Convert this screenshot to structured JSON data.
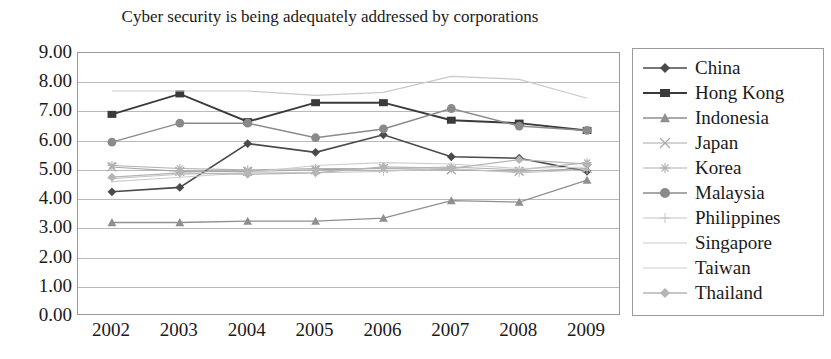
{
  "chart_data": {
    "type": "line",
    "title": "Cyber security is being adequately addressed by corporations",
    "xlabel": "",
    "ylabel": "",
    "categories": [
      "2002",
      "2003",
      "2004",
      "2005",
      "2006",
      "2007",
      "2008",
      "2009"
    ],
    "ylim": [
      0,
      9
    ],
    "ytick_step": 1,
    "yticks": [
      "9.00",
      "8.00",
      "7.00",
      "6.00",
      "5.00",
      "4.00",
      "3.00",
      "2.00",
      "1.00",
      "0.00"
    ],
    "grid": true,
    "legend_position": "right",
    "series": [
      {
        "name": "China",
        "marker": "diamond",
        "color": "#4a4a4a",
        "width": 1.6,
        "values": [
          4.25,
          4.4,
          5.9,
          5.6,
          6.2,
          5.45,
          5.4,
          4.95
        ]
      },
      {
        "name": "Hong Kong",
        "marker": "square",
        "color": "#3a3a3a",
        "width": 1.9,
        "values": [
          6.9,
          7.6,
          6.65,
          7.3,
          7.3,
          6.7,
          6.6,
          6.35
        ]
      },
      {
        "name": "Indonesia",
        "marker": "triangle",
        "color": "#8f8f8f",
        "width": 1.3,
        "values": [
          3.2,
          3.2,
          3.25,
          3.25,
          3.35,
          3.95,
          3.9,
          4.65
        ]
      },
      {
        "name": "Japan",
        "marker": "x",
        "color": "#a8a8a8",
        "width": 1.1,
        "values": [
          5.1,
          4.95,
          4.95,
          5.0,
          5.05,
          5.0,
          4.95,
          5.05
        ]
      },
      {
        "name": "Korea",
        "marker": "star",
        "color": "#b0b0b0",
        "width": 1.1,
        "values": [
          5.15,
          5.05,
          5.0,
          5.05,
          5.05,
          5.1,
          5.0,
          5.25
        ]
      },
      {
        "name": "Malaysia",
        "marker": "circle",
        "color": "#8a8a8a",
        "width": 1.5,
        "values": [
          5.95,
          6.6,
          6.6,
          6.1,
          6.4,
          7.1,
          6.5,
          6.35
        ]
      },
      {
        "name": "Philippines",
        "marker": "plus",
        "color": "#c4c4c4",
        "width": 1.0,
        "values": [
          4.7,
          4.85,
          4.9,
          4.9,
          4.95,
          5.05,
          4.9,
          5.0
        ]
      },
      {
        "name": "Singapore",
        "marker": "none",
        "color": "#c9c9c9",
        "width": 1.2,
        "values": [
          7.7,
          7.7,
          7.7,
          7.55,
          7.65,
          8.2,
          8.1,
          7.45
        ]
      },
      {
        "name": "Taiwan",
        "marker": "none",
        "color": "#cdcdcd",
        "width": 1.1,
        "values": [
          4.6,
          4.75,
          4.9,
          5.15,
          5.25,
          5.2,
          5.05,
          5.1
        ]
      },
      {
        "name": "Thailand",
        "marker": "diamond",
        "color": "#b5b5b5",
        "width": 1.3,
        "values": [
          4.75,
          4.9,
          4.85,
          4.9,
          5.1,
          5.05,
          5.35,
          5.2
        ]
      }
    ]
  },
  "legend": {
    "items": [
      {
        "label": "China"
      },
      {
        "label": "Hong Kong"
      },
      {
        "label": "Indonesia"
      },
      {
        "label": "Japan"
      },
      {
        "label": "Korea"
      },
      {
        "label": "Malaysia"
      },
      {
        "label": "Philippines"
      },
      {
        "label": "Singapore"
      },
      {
        "label": "Taiwan"
      },
      {
        "label": "Thailand"
      }
    ]
  }
}
